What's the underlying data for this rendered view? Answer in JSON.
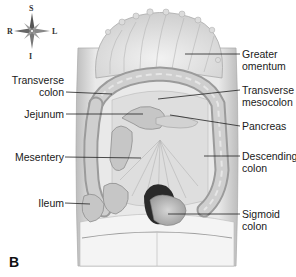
{
  "figure": {
    "panel_letter": "B"
  },
  "compass": {
    "top": "S",
    "bottom": "I",
    "left": "R",
    "right": "L"
  },
  "labels_right": [
    {
      "id": "greater-omentum",
      "line1": "Greater",
      "line2": "omentum"
    },
    {
      "id": "transverse-mesocolon",
      "line1": "Transverse",
      "line2": "mesocolon"
    },
    {
      "id": "pancreas",
      "line1": "Pancreas",
      "line2": ""
    },
    {
      "id": "descending-colon",
      "line1": "Descending",
      "line2": "colon"
    },
    {
      "id": "sigmoid-colon",
      "line1": "Sigmoid",
      "line2": "colon"
    }
  ],
  "labels_left": [
    {
      "id": "transverse-colon",
      "line1": "Transverse",
      "line2": "colon"
    },
    {
      "id": "jejunum",
      "line1": "Jejunum",
      "line2": ""
    },
    {
      "id": "mesentery",
      "line1": "Mesentery",
      "line2": ""
    },
    {
      "id": "ileum",
      "line1": "Ileum",
      "line2": ""
    }
  ],
  "colors": {
    "organ_fill": "#c9c9c9",
    "organ_dark": "#8f8f8f",
    "body_fill": "#ececec",
    "leader_line": "#222222"
  }
}
